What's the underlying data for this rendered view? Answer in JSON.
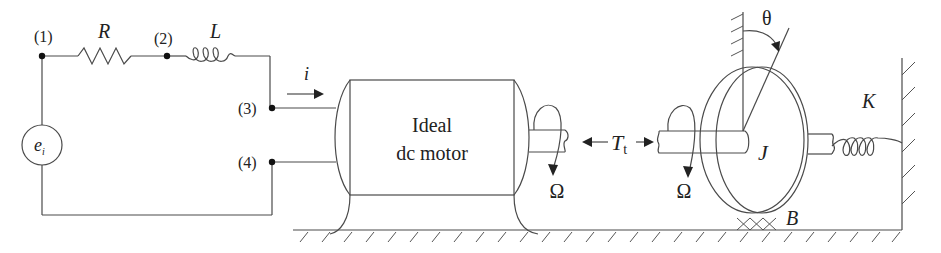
{
  "diagram": {
    "type": "electromechanical schematic",
    "circuit": {
      "nodes": [
        "(1)",
        "(2)",
        "(3)",
        "(4)"
      ],
      "resistor_label": "R",
      "inductor_label": "L",
      "source_label_main": "e",
      "source_label_sub": "i",
      "current_label": "i"
    },
    "motor": {
      "label_line1": "Ideal",
      "label_line2": "dc motor"
    },
    "mechanical": {
      "speed_label_left": "Ω",
      "speed_label_right": "Ω",
      "torque_label_main": "T",
      "torque_label_sub": "t",
      "inertia_label": "J",
      "angle_label": "θ",
      "damping_label": "B",
      "spring_label": "K"
    },
    "colors": {
      "line": "#4a4a4a",
      "text": "#222222",
      "background": "#ffffff"
    }
  }
}
